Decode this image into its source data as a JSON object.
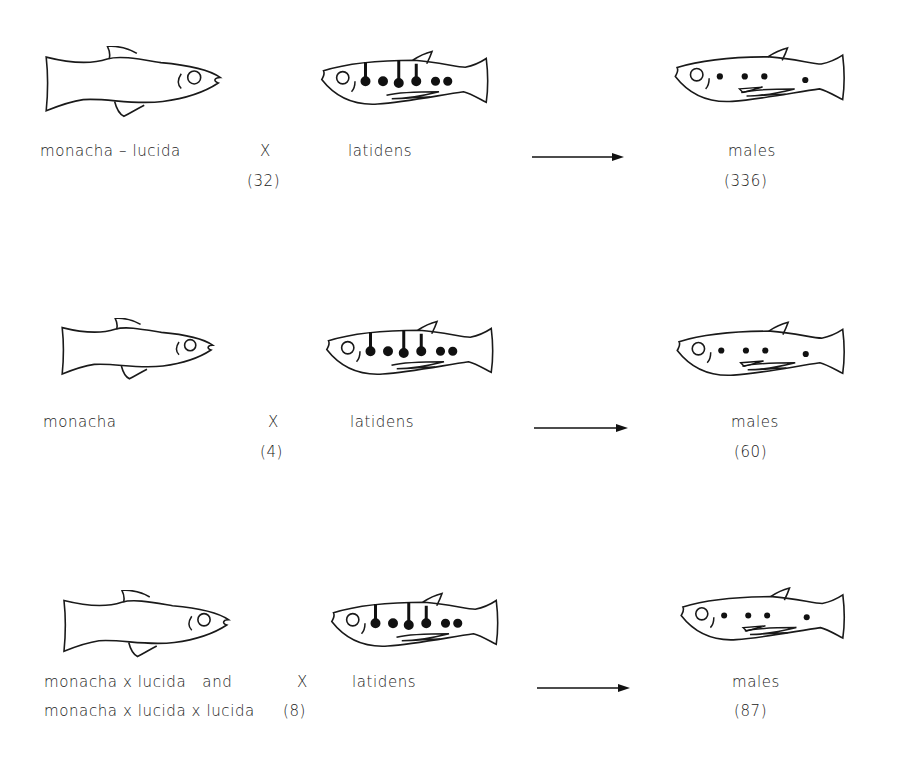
{
  "figure": {
    "rows": [
      {
        "female_label": "monacha – lucida",
        "female_label_line2": "",
        "cross_symbol": "X",
        "count": "(32)",
        "male_parent_label": "latidens",
        "offspring_label": "males",
        "offspring_count": "(336)"
      },
      {
        "female_label": "monacha",
        "female_label_line2": "",
        "cross_symbol": "X",
        "count": "(4)",
        "male_parent_label": "latidens",
        "offspring_label": "males",
        "offspring_count": "(60)"
      },
      {
        "female_label": "monacha x lucida   and",
        "female_label_line2": "monacha x lucida x lucida",
        "cross_symbol": "X",
        "count": "(8)",
        "male_parent_label": "latidens",
        "offspring_label": "males",
        "offspring_count": "(87)"
      }
    ],
    "icons": {
      "female_fish": "female-fish-outline",
      "male_parent_fish": "male-fish-barred",
      "offspring_fish": "male-fish-spotted",
      "arrow": "right-arrow"
    }
  }
}
